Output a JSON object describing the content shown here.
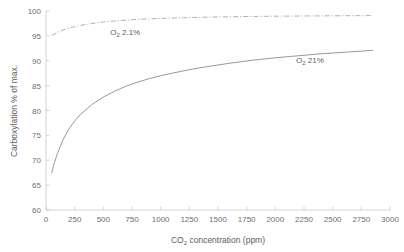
{
  "chart_data": {
    "type": "line",
    "title": "",
    "xlabel": "CO2 concentration (ppm)",
    "xlabel_base": "CO",
    "xlabel_sub": "2",
    "xlabel_rest": " concentration (ppm)",
    "ylabel": "Carboxylation % of max.",
    "xlim": [
      0,
      3000
    ],
    "ylim": [
      60,
      100
    ],
    "xticks": [
      0,
      250,
      500,
      750,
      1000,
      1250,
      1500,
      1750,
      2000,
      2250,
      2500,
      2750,
      3000
    ],
    "yticks": [
      60,
      65,
      70,
      75,
      80,
      85,
      90,
      95,
      100
    ],
    "grid": false,
    "legend_position": "inline-annotations",
    "series": [
      {
        "name": "O2 2.1%",
        "name_base": "O",
        "name_sub": "2",
        "name_rest": " 2.1%",
        "style": "dashdot",
        "color": "#a8a8a8",
        "annotation_x": 560,
        "annotation_y": 95.1,
        "x": [
          50,
          100,
          150,
          200,
          300,
          400,
          500,
          600,
          750,
          900,
          1050,
          1200,
          1400,
          1600,
          1800,
          2000,
          2200,
          2400,
          2600,
          2850
        ],
        "y": [
          95.1,
          95.7,
          96.2,
          96.6,
          97.1,
          97.5,
          97.8,
          98.0,
          98.25,
          98.42,
          98.55,
          98.65,
          98.76,
          98.84,
          98.9,
          98.95,
          98.99,
          99.02,
          99.05,
          99.08
        ]
      },
      {
        "name": "O2 21%",
        "name_base": "O",
        "name_sub": "2",
        "name_rest": " 21%",
        "style": "solid",
        "color": "#8d8d8d",
        "annotation_x": 2180,
        "annotation_y": 89.6,
        "x": [
          50,
          75,
          100,
          150,
          200,
          250,
          300,
          400,
          500,
          600,
          700,
          800,
          900,
          1000,
          1100,
          1250,
          1400,
          1600,
          1800,
          2000,
          2200,
          2400,
          2600,
          2850
        ],
        "y": [
          67.5,
          69.6,
          71.4,
          74.2,
          76.3,
          77.9,
          79.2,
          81.2,
          82.7,
          83.9,
          84.9,
          85.7,
          86.4,
          87.0,
          87.5,
          88.2,
          88.8,
          89.5,
          90.1,
          90.6,
          91.0,
          91.4,
          91.7,
          92.1
        ]
      }
    ]
  },
  "annotations": [
    {
      "id": "o2-2-1",
      "base": "O",
      "sub": "2",
      "rest": " 2.1%"
    },
    {
      "id": "o2-21",
      "base": "O",
      "sub": "2",
      "rest": " 21%"
    }
  ],
  "axis": {
    "ylabel_text": "Carboxylation % of max."
  }
}
